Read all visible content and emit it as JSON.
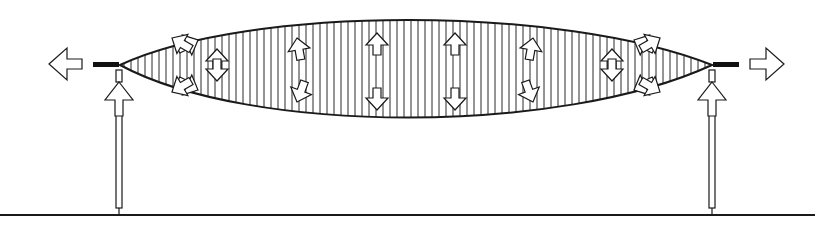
{
  "diagram": {
    "colors": {
      "stroke": "#1a1a1a",
      "fill": "#ffffff",
      "hatch": "#2a2a2a",
      "clamp": "#111111",
      "ground": "#1a1a1a"
    },
    "arrows": {
      "outward_tension": [
        "left",
        "right"
      ],
      "post_support": [
        "up",
        "up"
      ],
      "membrane_pairs": [
        {
          "position": "left-inner",
          "direction": "horizontal-outward"
        },
        {
          "position": "1",
          "direction": "vertical-outward"
        },
        {
          "position": "2",
          "direction": "vertical-outward"
        },
        {
          "position": "3",
          "direction": "vertical-outward"
        },
        {
          "position": "4",
          "direction": "vertical-outward"
        },
        {
          "position": "right-inner",
          "direction": "horizontal-outward"
        }
      ]
    }
  }
}
